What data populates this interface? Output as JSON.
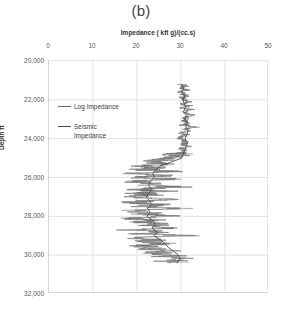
{
  "panel": {
    "title": "(b)"
  },
  "axes": {
    "x_title": "Impedance ( kft g)/(cc.s)",
    "y_title": "Depth ft",
    "x_ticks": [
      "0",
      "10",
      "20",
      "30",
      "40",
      "50"
    ],
    "y_ticks": [
      "20,000",
      "22,000",
      "24,000",
      "26,000",
      "28,000",
      "30,000",
      "32,000"
    ]
  },
  "legend": {
    "items": [
      {
        "label": "Log Impedance",
        "color": "#6b6b6b"
      },
      {
        "label": "Seismic Impedance",
        "color": "#4a4a4a"
      }
    ]
  },
  "colors": {
    "log_impedance": "#6b6b6b",
    "seismic_impedance": "#4a4a4a",
    "grid": "#e2e2e2",
    "axis": "#d6d6d6",
    "background": "#ffffff"
  },
  "chart_data": {
    "type": "line",
    "title": "(b)",
    "xlabel": "Impedance ( kft g)/(cc.s)",
    "ylabel": "Depth ft",
    "xlim": [
      0,
      50
    ],
    "ylim": [
      20000,
      32000
    ],
    "y_inverted": true,
    "grid": true,
    "legend_position": "inside-left",
    "orientation": "vertical-log-track",
    "series": [
      {
        "name": "Seismic Impedance",
        "comment": "smooth low-frequency trend, depth (ft) vs impedance",
        "depth": [
          21200,
          21400,
          21600,
          21800,
          22000,
          22200,
          22400,
          22600,
          22800,
          23000,
          23200,
          23400,
          23600,
          23800,
          24000,
          24200,
          24400,
          24600,
          24800,
          25000,
          25200,
          25400,
          25600,
          25800,
          26000,
          26200,
          26400,
          26600,
          26800,
          27000,
          27200,
          27400,
          27600,
          27800,
          28000,
          28200,
          28400,
          28600,
          28800,
          29000,
          29200,
          29400,
          29600,
          29800,
          30000,
          30200,
          30400
        ],
        "values": [
          30.2,
          30.6,
          30.1,
          30.9,
          30.4,
          30.8,
          31.0,
          30.6,
          31.2,
          30.9,
          31.4,
          31.1,
          31.6,
          31.3,
          30.9,
          31.5,
          31.2,
          30.8,
          30.5,
          30.2,
          27.8,
          25.4,
          24.2,
          23.6,
          23.9,
          23.1,
          22.6,
          23.4,
          22.8,
          22.1,
          22.9,
          23.3,
          22.4,
          23.0,
          22.2,
          23.6,
          24.1,
          23.4,
          24.6,
          23.9,
          25.2,
          26.4,
          27.1,
          28.3,
          29.4,
          29.8,
          29.1
        ]
      },
      {
        "name": "Log Impedance",
        "comment": "high-frequency well log; 2 ft sampling approximated by envelope",
        "depth": [
          21200,
          21300,
          21400,
          21500,
          21600,
          21700,
          21800,
          21900,
          22000,
          22100,
          22200,
          22300,
          22400,
          22500,
          22600,
          22700,
          22800,
          22900,
          23000,
          23100,
          23200,
          23300,
          23400,
          23500,
          23600,
          23700,
          23800,
          23900,
          24000,
          24100,
          24200,
          24300,
          24400,
          24500,
          24600,
          24700,
          24800,
          24900,
          25000,
          25100,
          25200,
          25300,
          25400,
          25500,
          25600,
          25700,
          25800,
          25900,
          26000,
          26100,
          26200,
          26300,
          26400,
          26500,
          26600,
          26700,
          26800,
          26900,
          27000,
          27100,
          27200,
          27300,
          27400,
          27500,
          27600,
          27700,
          27800,
          27900,
          28000,
          28100,
          28200,
          28300,
          28400,
          28500,
          28600,
          28700,
          28800,
          28900,
          29000,
          29100,
          29200,
          29300,
          29400,
          29500,
          29600,
          29700,
          29800,
          29900,
          30000,
          30100,
          30200,
          30300,
          30400
        ],
        "values": [
          30.1,
          30.8,
          30.0,
          31.2,
          29.8,
          30.6,
          31.4,
          30.2,
          30.9,
          31.6,
          30.3,
          31.8,
          30.1,
          32.2,
          30.6,
          31.1,
          33.4,
          30.8,
          31.3,
          30.4,
          31.9,
          30.2,
          34.1,
          30.7,
          31.5,
          30.0,
          31.2,
          30.6,
          29.4,
          30.8,
          31.0,
          30.3,
          31.6,
          30.1,
          30.9,
          30.4,
          29.8,
          28.6,
          27.2,
          24.8,
          22.1,
          26.4,
          19.8,
          24.2,
          21.6,
          27.8,
          18.9,
          25.4,
          20.2,
          28.6,
          17.8,
          24.6,
          21.2,
          29.8,
          18.4,
          26.2,
          20.8,
          23.4,
          19.2,
          27.6,
          21.4,
          18.6,
          25.8,
          20.4,
          30.2,
          17.6,
          23.8,
          21.0,
          28.4,
          18.2,
          24.4,
          19.8,
          26.6,
          21.8,
          29.2,
          18.8,
          25.2,
          20.6,
          31.4,
          19.4,
          23.2,
          22.4,
          27.2,
          20.2,
          24.8,
          22.8,
          26.8,
          23.6,
          28.8,
          26.2,
          30.4,
          27.6,
          29.2
        ]
      }
    ]
  }
}
